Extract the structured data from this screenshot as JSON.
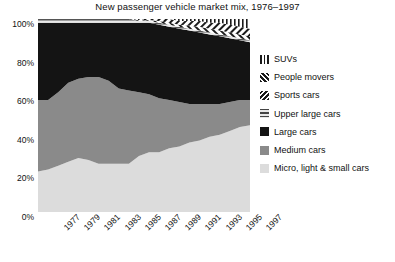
{
  "chart": {
    "title": "New passenger vehicle market mix, 1976–1997"
  },
  "axes": {
    "y_ticks": [
      "100%",
      "80%",
      "60%",
      "40%",
      "20%",
      "0%"
    ],
    "x_ticks": [
      "1977",
      "1979",
      "1981",
      "1983",
      "1985",
      "1987",
      "1989",
      "1991",
      "1993",
      "1995",
      "1997"
    ]
  },
  "legend": {
    "items": [
      {
        "label": "SUVs",
        "swatch": "vertical-stripe-swatch"
      },
      {
        "label": "People movers",
        "swatch": "diagonal-stripe-swatch"
      },
      {
        "label": "Sports cars",
        "swatch": "back-diagonal-stripe-swatch"
      },
      {
        "label": "Upper large cars",
        "swatch": "horizontal-stripe-swatch"
      },
      {
        "label": "Large cars",
        "swatch": "solid-black-swatch"
      },
      {
        "label": "Medium cars",
        "swatch": "mid-gray-swatch"
      },
      {
        "label": "Micro, light & small cars",
        "swatch": "light-gray-swatch"
      }
    ]
  },
  "colors": {
    "large_cars": "#141414",
    "medium_cars": "#8a8a8a",
    "small_cars": "#dcdcdc",
    "upper_large": "#b4b4b4",
    "hatch_ink": "#1a1a1a",
    "hatch_bg": "#ffffff",
    "axis": "#000000",
    "text": "#111111"
  },
  "chart_data": {
    "type": "area",
    "stacked": true,
    "title": "New passenger vehicle market mix, 1976–1997",
    "xlabel": "",
    "ylabel": "",
    "ylim": [
      0,
      100
    ],
    "grid": false,
    "legend_position": "right",
    "x": [
      1976,
      1977,
      1978,
      1979,
      1980,
      1981,
      1982,
      1983,
      1984,
      1985,
      1986,
      1987,
      1988,
      1989,
      1990,
      1991,
      1992,
      1993,
      1994,
      1995,
      1996,
      1997
    ],
    "series": [
      {
        "name": "Micro, light & small cars",
        "values": [
          21,
          22,
          24,
          26,
          28,
          27,
          25,
          25,
          25,
          25,
          29,
          31,
          31,
          33,
          34,
          36,
          37,
          39,
          40,
          42,
          44,
          45
        ]
      },
      {
        "name": "Medium cars",
        "values": [
          37,
          36,
          38,
          41,
          41,
          43,
          45,
          43,
          39,
          38,
          33,
          30,
          28,
          25,
          23,
          20,
          19,
          17,
          16,
          15,
          14,
          13
        ]
      },
      {
        "name": "Large cars",
        "values": [
          40,
          40,
          36,
          31,
          29,
          28,
          28,
          30,
          34,
          35,
          36,
          37,
          38,
          38,
          38,
          38,
          37,
          36,
          35,
          33,
          31,
          30
        ]
      },
      {
        "name": "Upper large cars",
        "values": [
          2,
          2,
          2,
          2,
          2,
          2,
          2,
          2,
          2,
          2,
          1,
          1,
          1,
          1,
          1,
          1,
          1,
          1,
          1,
          1,
          1,
          1
        ]
      },
      {
        "name": "Sports cars",
        "values": [
          0,
          0,
          0,
          0,
          0,
          0,
          0,
          0,
          0,
          0,
          0,
          0.5,
          1,
          1,
          1,
          1.5,
          2,
          2,
          2,
          2,
          2,
          2
        ]
      },
      {
        "name": "People movers",
        "values": [
          0,
          0,
          0,
          0,
          0,
          0,
          0,
          0,
          0,
          0,
          0.5,
          1,
          1,
          2,
          2,
          2.5,
          3,
          3,
          4,
          4,
          4,
          4
        ]
      },
      {
        "name": "SUVs",
        "values": [
          0,
          0,
          0,
          0,
          0,
          0,
          0,
          0,
          0,
          0,
          0.5,
          0.5,
          1,
          1,
          2,
          2,
          2,
          3,
          3,
          4,
          5,
          5
        ]
      }
    ]
  }
}
